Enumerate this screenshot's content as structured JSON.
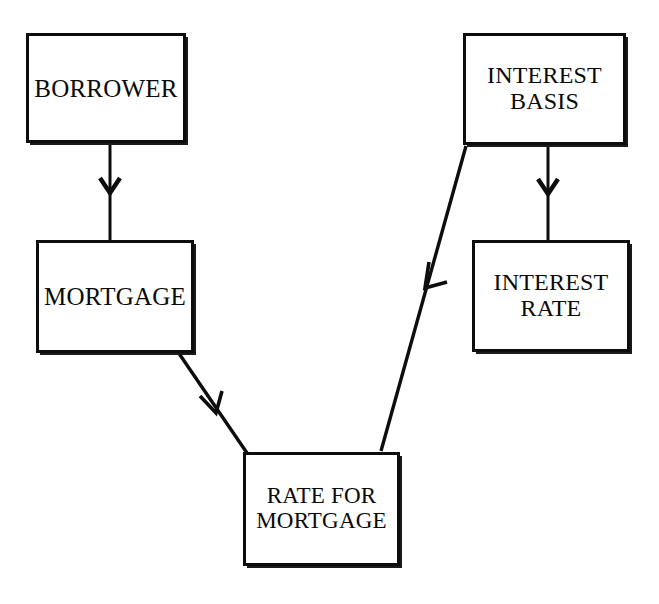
{
  "diagram": {
    "type": "flowchart",
    "background_color": "#ffffff",
    "stroke_color": "#0d0d0d",
    "text_color": "#0a0a0a",
    "nodes": [
      {
        "id": "borrower",
        "label": "BORROWER",
        "shape": "rectangle",
        "x": 26,
        "y": 33,
        "width": 160,
        "height": 110
      },
      {
        "id": "mortgage",
        "label": "MORTGAGE",
        "shape": "rectangle",
        "x": 36,
        "y": 240,
        "width": 158,
        "height": 113
      },
      {
        "id": "interest_basis",
        "label": "INTEREST\nBASIS",
        "shape": "rectangle",
        "x": 463,
        "y": 33,
        "width": 163,
        "height": 112
      },
      {
        "id": "interest_rate",
        "label": "INTEREST\nRATE",
        "shape": "rectangle",
        "x": 472,
        "y": 240,
        "width": 158,
        "height": 112
      },
      {
        "id": "rate_for_mortgage",
        "label": "RATE FOR\nMORTGAGE",
        "shape": "rectangle",
        "x": 243,
        "y": 452,
        "width": 157,
        "height": 114
      }
    ],
    "edges": [
      {
        "id": "borrower-to-mortgage",
        "from": "borrower",
        "to": "mortgage",
        "style": "straight-vertical",
        "arrowhead": "open-v"
      },
      {
        "id": "interest-basis-to-interest-rate",
        "from": "interest_basis",
        "to": "interest_rate",
        "style": "straight-vertical",
        "arrowhead": "open-v"
      },
      {
        "id": "mortgage-to-rate-for-mortgage",
        "from": "mortgage",
        "to": "rate_for_mortgage",
        "style": "diagonal",
        "arrowhead": "open-v"
      },
      {
        "id": "interest-basis-to-rate-for-mortgage",
        "from": "interest_basis",
        "to": "rate_for_mortgage",
        "style": "diagonal",
        "arrowhead": "open-v"
      }
    ]
  }
}
